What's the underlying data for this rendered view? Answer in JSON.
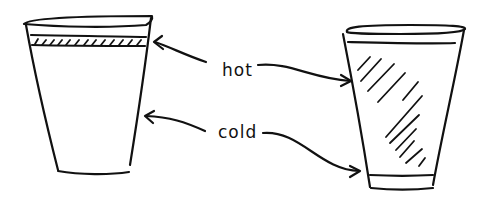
{
  "diagram": {
    "labels": {
      "hot": "hot",
      "cold": "cold"
    },
    "cups": [
      {
        "name": "left-cup",
        "description": "foam cup with hatched band near rim"
      },
      {
        "name": "right-cup",
        "description": "cup with diagonal shading on body and plain band at bottom"
      }
    ],
    "colors": {
      "ink": "#111111",
      "background": "#ffffff"
    }
  }
}
